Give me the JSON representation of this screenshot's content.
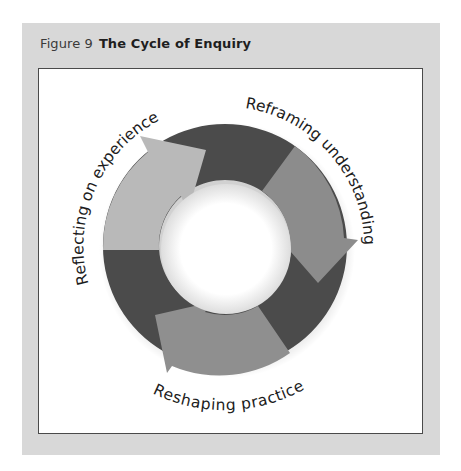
{
  "figure": {
    "number_label": "Figure 9",
    "title": "The Cycle of Enquiry"
  },
  "cycle": {
    "stages": [
      {
        "label": "Reflecting on experience",
        "arrow_color": "#b9b9b9",
        "position": "left"
      },
      {
        "label": "Reframing understanding",
        "arrow_color": "#8c8c8c",
        "position": "top-right"
      },
      {
        "label": "Reshaping practice",
        "arrow_color": "#8f8f8f",
        "position": "bottom"
      }
    ],
    "connector_color": "#4b4b4b",
    "direction": "clockwise"
  },
  "colors": {
    "panel_background": "#d8d8d8",
    "box_background": "#ffffff",
    "box_border": "#4a4a4a"
  }
}
